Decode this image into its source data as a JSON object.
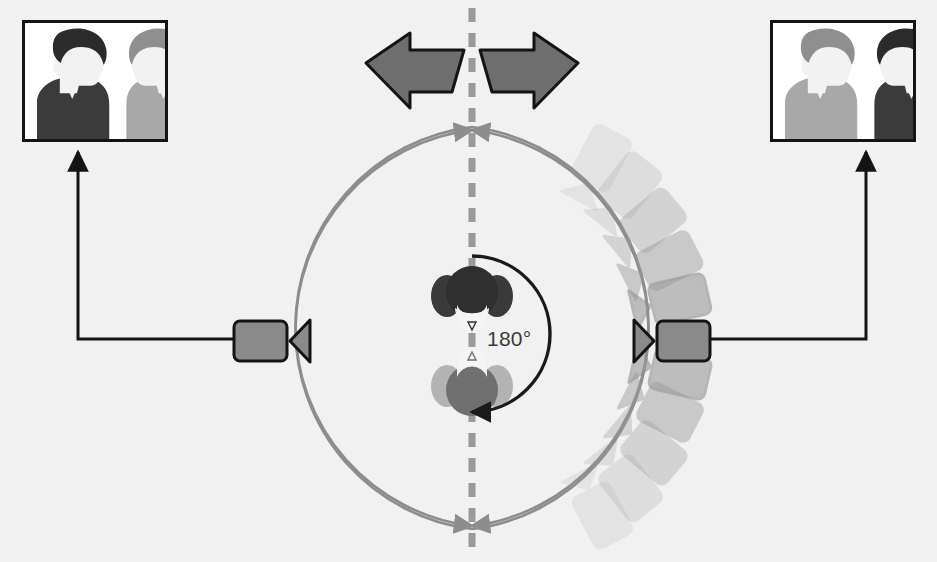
{
  "diagram": {
    "background_color": "#f1f1f1",
    "angle_label": "180°",
    "axis": {
      "name": "line-of-action",
      "color": "#9a9a9a",
      "orientation": "vertical",
      "x": 472,
      "dash": "14 11",
      "width": 7
    },
    "action_circle": {
      "name": "camera-travel-circle",
      "color": "#8d8d8d",
      "center_x": 472,
      "center_y": 328,
      "radius": 201,
      "stroke_width": 2.6,
      "arrowheads": [
        "top",
        "bottom"
      ]
    },
    "rotation_arrow": {
      "name": "rotation-arrow-180",
      "color": "#1a1a1a",
      "degrees": 180,
      "direction": "clockwise-down",
      "radius": 78
    },
    "break_arrow": {
      "name": "double-headed-break-arrow",
      "fill": "#6e6e6e",
      "stroke": "#141414",
      "left_label": "left",
      "right_label": "right"
    },
    "connectors": {
      "color": "#141414",
      "width": 3
    },
    "cameras": [
      {
        "id": "camera-left",
        "label": "Camera A",
        "x": 264,
        "y": 336,
        "facing": "right",
        "body_fill": "#8a8a8a",
        "lens_fill": "#8a8a8a",
        "stroke": "#141414",
        "opacity": 1
      },
      {
        "id": "camera-right",
        "label": "Camera B",
        "x": 681,
        "y": 336,
        "facing": "left",
        "body_fill": "#8a8a8a",
        "lens_fill": "#8a8a8a",
        "stroke": "#141414",
        "opacity": 1
      }
    ],
    "ghost_cameras": {
      "name": "ghost-camera-trail",
      "count": 10,
      "fill": "#9b9b9b",
      "stroke": "#8a8a8a",
      "angles_deg": [
        -70,
        -55,
        -40,
        -25,
        -12,
        12,
        25,
        40,
        55,
        70
      ],
      "opacities": [
        0.16,
        0.26,
        0.38,
        0.52,
        0.7,
        0.7,
        0.52,
        0.38,
        0.26,
        0.16
      ]
    },
    "subjects": [
      {
        "id": "subject-top",
        "label": "Subject 1",
        "x": 472,
        "y": 292,
        "facing": "down",
        "head_fill": "#2f2f2f",
        "shoulder_fill": "#3a3a3a",
        "face_fill": "#f4f4f4"
      },
      {
        "id": "subject-bottom",
        "label": "Subject 2",
        "x": 472,
        "y": 390,
        "facing": "up",
        "head_fill": "#6f6f6f",
        "shoulder_fill": "#b3b3b3",
        "face_fill": "#f4f4f4"
      }
    ],
    "insets": [
      {
        "id": "inset-left",
        "name": "shot-from-camera-left",
        "source_camera": "camera-left",
        "frame_color": "#141414",
        "background": "#ffffff",
        "people": [
          {
            "position": "left",
            "facing": "right",
            "tone": "dark",
            "hair": "#2b2b2b",
            "body": "#3b3b3b",
            "skin": "#f2f2f2"
          },
          {
            "position": "right",
            "facing": "left",
            "tone": "light",
            "hair": "#8f8f8f",
            "body": "#a8a8a8",
            "skin": "#f2f2f2"
          }
        ]
      },
      {
        "id": "inset-right",
        "name": "shot-from-camera-right",
        "source_camera": "camera-right",
        "frame_color": "#141414",
        "background": "#ffffff",
        "people": [
          {
            "position": "left",
            "facing": "right",
            "tone": "light",
            "hair": "#8f8f8f",
            "body": "#a8a8a8",
            "skin": "#f2f2f2"
          },
          {
            "position": "right",
            "facing": "left",
            "tone": "dark",
            "hair": "#2b2b2b",
            "body": "#3b3b3b",
            "skin": "#f2f2f2"
          }
        ]
      }
    ]
  }
}
